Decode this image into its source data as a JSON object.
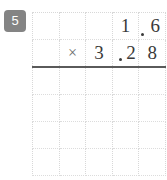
{
  "problem": {
    "number": "5",
    "operator": "×",
    "multiplicand": "1.6",
    "multiplier": "3.28",
    "row1": {
      "c1": "",
      "c2": "",
      "c3": "",
      "c4": "1",
      "c5_point": ".",
      "c5": "6"
    },
    "row2": {
      "c1": "",
      "c2": "×",
      "c3": "3",
      "c3_point": ".",
      "c4": "2",
      "c5": "8"
    },
    "work_rows": [
      {
        "c1": "",
        "c2": "",
        "c3": "",
        "c4": "",
        "c5": ""
      },
      {
        "c1": "",
        "c2": "",
        "c3": "",
        "c4": "",
        "c5": ""
      },
      {
        "c1": "",
        "c2": "",
        "c3": "",
        "c4": "",
        "c5": ""
      },
      {
        "c1": "",
        "c2": "",
        "c3": "",
        "c4": "",
        "c5": ""
      }
    ]
  },
  "colors": {
    "badge_bg": "#848484",
    "badge_text": "#ffffff",
    "grid_line": "#d8d8d8",
    "rule_line": "#5a5a5a",
    "digit_text": "#3a3a3a",
    "operator_text": "#6b6b6b",
    "page_bg": "#ffffff"
  }
}
